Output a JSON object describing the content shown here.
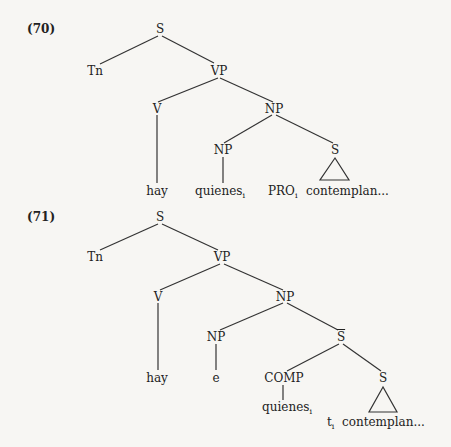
{
  "trees": [
    {
      "number": "(70)",
      "nodes": {
        "S": "S",
        "Tn": "Tn",
        "VP": "VP",
        "V": "V",
        "NP": "NP",
        "NP_lower": "NP",
        "S_embedded": "S"
      },
      "leaves": {
        "hay": "hay",
        "quienes": "quienes",
        "quienes_index": "i",
        "PRO": "PRO",
        "PRO_index": "i",
        "contemplan": "contemplan..."
      }
    },
    {
      "number": "(71)",
      "nodes": {
        "S": "S",
        "Tn": "Tn",
        "VP": "VP",
        "V": "V",
        "NP": "NP",
        "NP_lower": "NP",
        "S_bar": "S",
        "COMP": "COMP",
        "S_embedded": "S"
      },
      "leaves": {
        "hay": "hay",
        "e": "e",
        "quienes": "quienes",
        "quienes_index": "i",
        "t": "t",
        "t_index": "i",
        "contemplan": "contemplan..."
      }
    }
  ]
}
